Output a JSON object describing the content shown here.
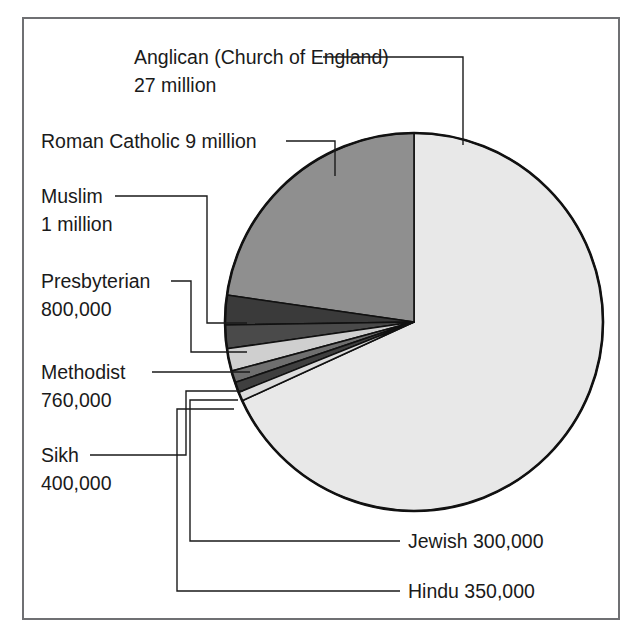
{
  "figure": {
    "title": "",
    "frame_color": "#6f7073",
    "background": "#ffffff"
  },
  "chart_data": {
    "type": "pie",
    "title": "",
    "xlabel": "",
    "ylabel": "",
    "units": "people",
    "legend_position": "none",
    "grid": false,
    "start_angle_deg": 0,
    "direction": "clockwise",
    "categories": [
      "Anglican (Church of England)",
      "Roman Catholic",
      "Muslim",
      "Presbyterian",
      "Methodist",
      "Sikh",
      "Hindu",
      "Jewish"
    ],
    "values": [
      27000000,
      9000000,
      1000000,
      800000,
      760000,
      400000,
      350000,
      300000
    ],
    "value_labels": [
      "27 million",
      "9 million",
      "1 million",
      "800,000",
      "760,000",
      "400,000",
      "350,000",
      "300,000"
    ],
    "colors": [
      "#e8e8e8",
      "#8f8f8f",
      "#3a3a3a",
      "#4a4a4a",
      "#cfcfcf",
      "#6f6f6f",
      "#3f3f3f",
      "#dcdcdc"
    ],
    "slices": [
      {
        "name": "Anglican (Church of England)",
        "value": 27000000,
        "value_label": "27 million",
        "color": "#e8e8e8"
      },
      {
        "name": "Roman Catholic",
        "value": 9000000,
        "value_label": "9 million",
        "color": "#8f8f8f"
      },
      {
        "name": "Muslim",
        "value": 1000000,
        "value_label": "1 million",
        "color": "#3a3a3a"
      },
      {
        "name": "Presbyterian",
        "value": 800000,
        "value_label": "800,000",
        "color": "#4a4a4a"
      },
      {
        "name": "Methodist",
        "value": 760000,
        "value_label": "760,000",
        "color": "#cfcfcf"
      },
      {
        "name": "Sikh",
        "value": 400000,
        "value_label": "400,000",
        "color": "#6f6f6f"
      },
      {
        "name": "Hindu",
        "value": 350000,
        "value_label": "350,000",
        "color": "#3f3f3f"
      },
      {
        "name": "Jewish",
        "value": 300000,
        "value_label": "300,000",
        "color": "#dcdcdc"
      }
    ]
  },
  "labels": {
    "anglican_line1": "Anglican (Church of England)",
    "anglican_line2": "27 million",
    "roman_catholic": "Roman Catholic 9 million",
    "muslim_line1": "Muslim",
    "muslim_line2": "1 million",
    "presbyterian_line1": "Presbyterian",
    "presbyterian_line2": "800,000",
    "methodist_line1": "Methodist",
    "methodist_line2": "760,000",
    "sikh_line1": "Sikh",
    "sikh_line2": "400,000",
    "jewish": "Jewish 300,000",
    "hindu": "Hindu 350,000"
  }
}
